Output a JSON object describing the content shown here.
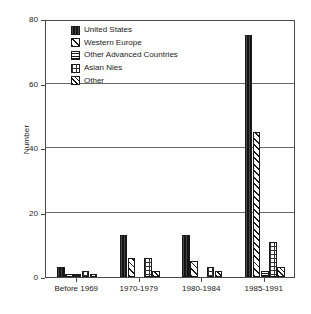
{
  "chart_data": {
    "type": "bar",
    "title": "",
    "subtitle": "",
    "xlabel": "",
    "ylabel": "Number",
    "categories": [
      "Before 1969",
      "1970-1979",
      "1980-1984",
      "1985-1991"
    ],
    "series": [
      {
        "name": "United States",
        "pattern": "solid-black",
        "values": [
          3,
          13,
          13,
          75
        ]
      },
      {
        "name": "Western Europe",
        "pattern": "diagonal-hatch",
        "values": [
          1,
          6,
          5,
          45
        ]
      },
      {
        "name": "Other Advanced Countries",
        "pattern": "dense-checker",
        "values": [
          1,
          0,
          0,
          2
        ]
      },
      {
        "name": "Asian Nies",
        "pattern": "sparse-dots",
        "values": [
          2,
          6,
          3,
          11
        ]
      },
      {
        "name": "Other",
        "pattern": "cross-hatch",
        "values": [
          1,
          2,
          2,
          3
        ]
      }
    ],
    "ylim": [
      0,
      80
    ],
    "yticks": [
      0,
      20,
      40,
      60,
      80
    ],
    "ytick_labels": [
      "0",
      "20",
      "40",
      "60",
      "80"
    ],
    "grid": "horizontal",
    "legend_position": "top-left-inside",
    "bar_border_color": "#1a1a1a",
    "axis_color": "#4a4a4a",
    "background_color": "#ffffff"
  }
}
